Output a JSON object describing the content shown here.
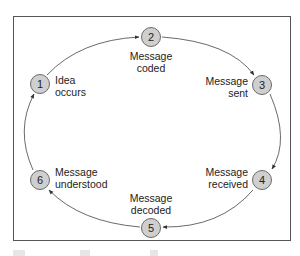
{
  "diagram": {
    "type": "communication-cycle",
    "direction": "clockwise",
    "colors": {
      "node_fill": "#cfcfcf",
      "node_stroke": "#6a6a6a",
      "edge": "#444444",
      "frame": "#555555"
    },
    "steps": [
      {
        "number": "1",
        "line1": "Idea",
        "line2": "occurs"
      },
      {
        "number": "2",
        "line1": "Message",
        "line2": "coded"
      },
      {
        "number": "3",
        "line1": "Message",
        "line2": "sent"
      },
      {
        "number": "4",
        "line1": "Message",
        "line2": "received"
      },
      {
        "number": "5",
        "line1": "Message",
        "line2": "decoded"
      },
      {
        "number": "6",
        "line1": "Message",
        "line2": "understood"
      }
    ],
    "edges": [
      {
        "from": "1",
        "to": "2"
      },
      {
        "from": "2",
        "to": "3"
      },
      {
        "from": "3",
        "to": "4"
      },
      {
        "from": "4",
        "to": "5"
      },
      {
        "from": "5",
        "to": "6"
      },
      {
        "from": "6",
        "to": "1"
      }
    ]
  }
}
